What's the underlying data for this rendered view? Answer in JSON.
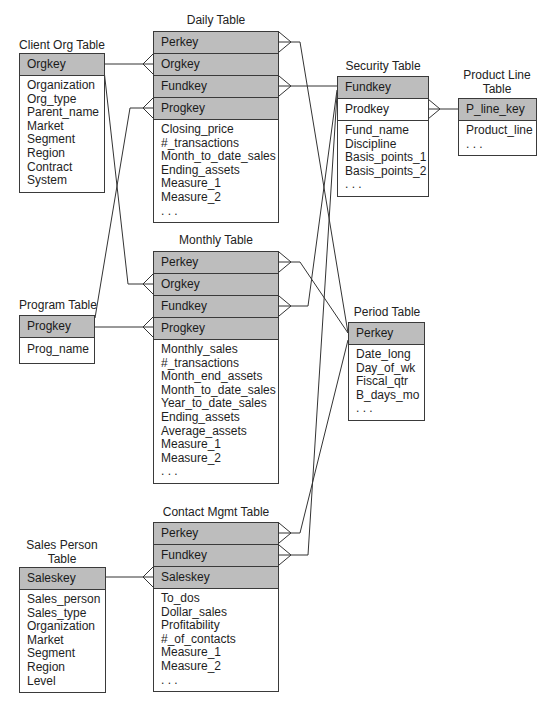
{
  "tables": {
    "daily": {
      "title": "Daily Table",
      "keys": [
        "Perkey",
        "Orgkey",
        "Fundkey",
        "Progkey"
      ],
      "fields": [
        "Closing_price",
        "#_transactions",
        "Month_to_date_sales",
        "Ending_assets",
        "Measure_1",
        "Measure_2",
        ". . ."
      ]
    },
    "client_org": {
      "title": "Client Org Table",
      "keys": [
        "Orgkey"
      ],
      "fields": [
        "Organization",
        "Org_type",
        "Parent_name",
        "Market",
        "Segment",
        "Region",
        "Contract",
        "System"
      ]
    },
    "security": {
      "title": "Security Table",
      "keys": [
        "Fundkey",
        "Prodkey"
      ],
      "fields": [
        "Fund_name",
        "Discipline",
        "Basis_points_1",
        "Basis_points_2",
        ". . ."
      ]
    },
    "product_line": {
      "title_line1": "Product Line",
      "title_line2": "Table",
      "keys": [
        "P_line_key"
      ],
      "fields": [
        "Product_line",
        ". . ."
      ]
    },
    "monthly": {
      "title": "Monthly Table",
      "keys": [
        "Perkey",
        "Orgkey",
        "Fundkey",
        "Progkey"
      ],
      "fields": [
        "Monthly_sales",
        "#_transactions",
        "Month_end_assets",
        "Month_to_date_sales",
        "Year_to_date_sales",
        "Ending_assets",
        "Average_assets",
        "Measure_1",
        "Measure_2",
        ". . ."
      ]
    },
    "program": {
      "title": "Program Table",
      "keys": [
        "Progkey"
      ],
      "fields": [
        "Prog_name"
      ]
    },
    "period": {
      "title": "Period Table",
      "keys": [
        "Perkey"
      ],
      "fields": [
        "Date_long",
        "Day_of_wk",
        "Fiscal_qtr",
        "B_days_mo",
        ". . ."
      ]
    },
    "contact_mgmt": {
      "title": "Contact Mgmt Table",
      "keys": [
        "Perkey",
        "Fundkey",
        "Saleskey"
      ],
      "fields": [
        "To_dos",
        "Dollar_sales",
        "Profitability",
        "#_of_contacts",
        "Measure_1",
        "Measure_2",
        ". . ."
      ]
    },
    "sales_person": {
      "title_line1": "Sales Person",
      "title_line2": "Table",
      "keys": [
        "Saleskey"
      ],
      "fields": [
        "Sales_person",
        "Sales_type",
        "Organization",
        "Market",
        "Segment",
        "Region",
        "Level"
      ]
    }
  },
  "relationships": [
    {
      "from": "Client Org Table.Orgkey",
      "to": "Daily Table.Orgkey"
    },
    {
      "from": "Client Org Table.Orgkey",
      "to": "Monthly Table.Orgkey"
    },
    {
      "from": "Program Table.Progkey",
      "to": "Daily Table.Progkey"
    },
    {
      "from": "Program Table.Progkey",
      "to": "Monthly Table.Progkey"
    },
    {
      "from": "Security Table.Fundkey",
      "to": "Daily Table.Fundkey"
    },
    {
      "from": "Security Table.Fundkey",
      "to": "Monthly Table.Fundkey"
    },
    {
      "from": "Security Table.Fundkey",
      "to": "Contact Mgmt Table.Fundkey"
    },
    {
      "from": "Period Table.Perkey",
      "to": "Daily Table.Perkey"
    },
    {
      "from": "Period Table.Perkey",
      "to": "Monthly Table.Perkey"
    },
    {
      "from": "Period Table.Perkey",
      "to": "Contact Mgmt Table.Perkey"
    },
    {
      "from": "Product Line Table.P_line_key",
      "to": "Security Table.Prodkey"
    },
    {
      "from": "Sales Person Table.Saleskey",
      "to": "Contact Mgmt Table.Saleskey"
    }
  ],
  "colors": {
    "key_fill": "#bdbdbd",
    "border": "#3a3a3a",
    "line": "#333333"
  }
}
